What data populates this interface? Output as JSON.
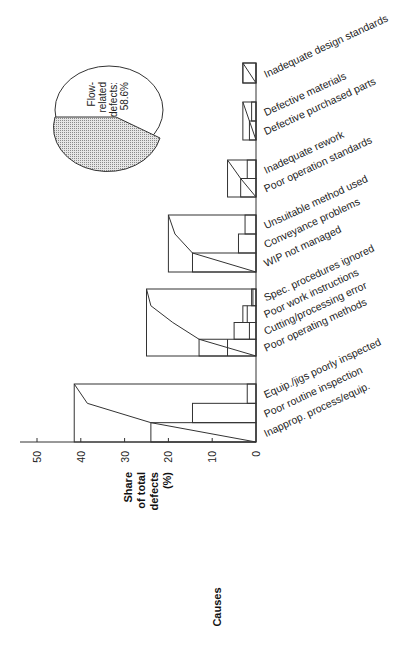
{
  "chart_data": {
    "type": "bar",
    "subtype": "stacked-pareto-groups",
    "orientation": "rotated (value axis horizontal, categories vertical)",
    "ylabel": "Share of total defects (%)",
    "xlabel": "Causes",
    "ylim": [
      0,
      50
    ],
    "ticks": [
      "0",
      "10",
      "20",
      "30",
      "40",
      "50"
    ],
    "groups": [
      {
        "total": 41.5,
        "categories": [
          "Inapprop. process/equip.",
          "Poor routine inspection",
          "Equip./jigs poorly inspected"
        ],
        "values": [
          24,
          14.5,
          2
        ],
        "cumulative": [
          0,
          24,
          38.5,
          41.5
        ]
      },
      {
        "total": 25,
        "categories": [
          "Poor operating methods",
          "Cutting/processing error",
          "Poor work instructions",
          "Spec. procedures ignored"
        ],
        "values": [
          13,
          5,
          3,
          1
        ],
        "inner_marks": [
          6.5,
          1.5,
          2,
          0.7
        ],
        "cumulative": [
          0,
          13,
          19,
          24,
          25
        ]
      },
      {
        "total": 20,
        "categories": [
          "WIP not managed",
          "Conveyance problems",
          "Unsuitable method used"
        ],
        "values": [
          14.5,
          4,
          2.5
        ],
        "cumulative": [
          0,
          14.5,
          18.5,
          20
        ]
      },
      {
        "total": 6.5,
        "categories": [
          "Poor operation standards",
          "Inadequate rework"
        ],
        "values": [
          3.5,
          2
        ],
        "cumulative": [
          0,
          3.5,
          6.5
        ]
      },
      {
        "total": 3,
        "categories": [
          "Defective purchased parts",
          "Defective materials"
        ],
        "values": [
          1.5,
          1
        ],
        "cumulative": [
          0,
          1.5,
          3
        ]
      },
      {
        "total": 3,
        "categories": [
          "Inadequate design standards"
        ],
        "values": [
          3
        ],
        "cumulative": [
          0,
          3
        ]
      }
    ],
    "inset_pie": {
      "type": "pie",
      "slices": [
        {
          "label": "Flow-related defects",
          "value": 58.6,
          "fill": "#ffffff"
        },
        {
          "label": "Other defects",
          "value": 41.4,
          "fill": "#c8c8c8"
        }
      ],
      "annotation": "Flow-related defects: 58.6%"
    }
  },
  "labels": {
    "axis_title_lines": [
      "Share",
      "of total",
      "defects",
      "(%)"
    ],
    "causes_title": "Causes",
    "pie_lines": [
      "Flow-",
      "related",
      "defects:",
      "58.6%"
    ]
  },
  "colors": {
    "line": "#333333",
    "shade": "#c8c8c8",
    "background": "#ffffff"
  }
}
